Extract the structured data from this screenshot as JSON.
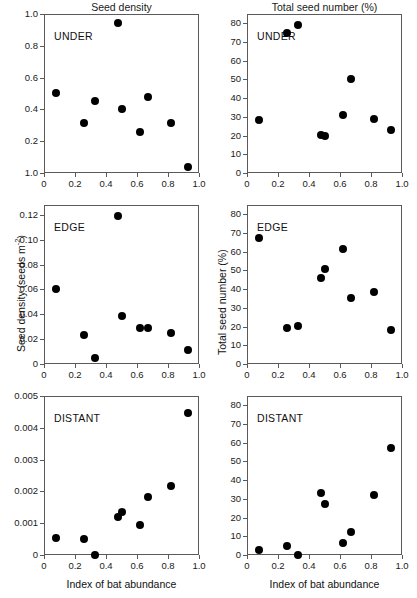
{
  "figure": {
    "column_titles": [
      "Seed density",
      "Total seed number (%)"
    ],
    "x_axis_label": "Index of bat abundance",
    "x_ticks": [
      "0",
      "0.2",
      "0.4",
      "0.6",
      "0.8",
      "1.0"
    ],
    "x_range": [
      0,
      1
    ],
    "marker_color": "#000000",
    "axis_color": "#5a5a5a"
  },
  "chart_data": [
    {
      "type": "scatter",
      "panel": "top-left",
      "title": "Seed density",
      "annotation": "UNDER",
      "xlabel": "",
      "ylabel": "",
      "xlim": [
        0,
        1
      ],
      "ylim": [
        0,
        1
      ],
      "xticks": [
        "0",
        "0.2",
        "0.4",
        "0.6",
        "0.8",
        "1.0"
      ],
      "yticks": [
        "1.0",
        "0.8",
        "0.6",
        "0.4",
        "0.2",
        "1.0"
      ],
      "ytick_values": [
        1.0,
        0.8,
        0.6,
        0.4,
        0.2,
        0.0
      ],
      "grid": false,
      "legend": "none",
      "x": [
        0.08,
        0.26,
        0.33,
        0.48,
        0.5,
        0.62,
        0.67,
        0.82,
        0.93
      ],
      "y": [
        0.505,
        0.315,
        0.455,
        0.945,
        0.405,
        0.255,
        0.475,
        0.315,
        0.035
      ]
    },
    {
      "type": "scatter",
      "panel": "top-right",
      "title": "Total seed number (%)",
      "annotation": "UNDER",
      "xlabel": "",
      "ylabel": "",
      "xlim": [
        0,
        1
      ],
      "ylim": [
        0,
        85
      ],
      "xticks": [
        "0",
        "0.2",
        "0.4",
        "0.6",
        "0.8",
        "1.0"
      ],
      "yticks": [
        "80",
        "70",
        "60",
        "50",
        "40",
        "30",
        "20",
        "10",
        "0"
      ],
      "ytick_values": [
        80,
        70,
        60,
        50,
        40,
        30,
        20,
        10,
        0
      ],
      "grid": false,
      "legend": "none",
      "x": [
        0.08,
        0.26,
        0.33,
        0.48,
        0.5,
        0.62,
        0.67,
        0.82,
        0.93
      ],
      "y": [
        28.5,
        75.0,
        79.0,
        20.5,
        20.0,
        31.0,
        50.5,
        29.0,
        23.0
      ]
    },
    {
      "type": "scatter",
      "panel": "middle-left",
      "title": "",
      "annotation": "EDGE",
      "xlabel": "",
      "ylabel": "Seed density (seeds m-2)",
      "xlim": [
        0,
        1
      ],
      "ylim": [
        0,
        0.128
      ],
      "xticks": [
        "0",
        "0.2",
        "0.4",
        "0.6",
        "0.8",
        "1.0"
      ],
      "yticks": [
        "0.12",
        "0.10",
        "0.08",
        "0.06",
        "0.04",
        "0.02",
        "0"
      ],
      "ytick_values": [
        0.12,
        0.1,
        0.08,
        0.06,
        0.04,
        0.02,
        0
      ],
      "grid": false,
      "legend": "none",
      "x": [
        0.08,
        0.26,
        0.33,
        0.48,
        0.5,
        0.62,
        0.67,
        0.82,
        0.93
      ],
      "y": [
        0.06,
        0.023,
        0.005,
        0.119,
        0.039,
        0.029,
        0.029,
        0.025,
        0.011
      ]
    },
    {
      "type": "scatter",
      "panel": "middle-right",
      "title": "",
      "annotation": "EDGE",
      "xlabel": "",
      "ylabel": "Total seed number (%)",
      "xlim": [
        0,
        1
      ],
      "ylim": [
        0,
        85
      ],
      "xticks": [
        "0",
        "0.2",
        "0.4",
        "0.6",
        "0.8",
        "1.0"
      ],
      "yticks": [
        "80",
        "70",
        "60",
        "50",
        "40",
        "30",
        "20",
        "10",
        "0"
      ],
      "ytick_values": [
        80,
        70,
        60,
        50,
        40,
        30,
        20,
        10,
        0
      ],
      "grid": false,
      "legend": "none",
      "x": [
        0.08,
        0.26,
        0.33,
        0.48,
        0.5,
        0.62,
        0.67,
        0.82,
        0.93
      ],
      "y": [
        67.5,
        19.0,
        20.5,
        46.0,
        51.0,
        61.5,
        35.5,
        38.5,
        18.0
      ]
    },
    {
      "type": "scatter",
      "panel": "bottom-left",
      "title": "",
      "annotation": "DISTANT",
      "xlabel": "Index of bat abundance",
      "ylabel": "",
      "xlim": [
        0,
        1
      ],
      "ylim": [
        0,
        0.005
      ],
      "xticks": [
        "0",
        "0.2",
        "0.4",
        "0.6",
        "0.8",
        "1.0"
      ],
      "yticks": [
        "0.005",
        "0.004",
        "0.003",
        "0.002",
        "0.001",
        "0"
      ],
      "ytick_values": [
        0.005,
        0.004,
        0.003,
        0.002,
        0.001,
        0
      ],
      "grid": false,
      "legend": "none",
      "x": [
        0.08,
        0.26,
        0.33,
        0.48,
        0.5,
        0.62,
        0.67,
        0.82,
        0.93
      ],
      "y": [
        0.00055,
        0.0005,
        0.0,
        0.0012,
        0.00135,
        0.00095,
        0.00182,
        0.00217,
        0.00445
      ]
    },
    {
      "type": "scatter",
      "panel": "bottom-right",
      "title": "",
      "annotation": "DISTANT",
      "xlabel": "Index of bat abundance",
      "ylabel": "",
      "xlim": [
        0,
        1
      ],
      "ylim": [
        0,
        85
      ],
      "xticks": [
        "0",
        "0.2",
        "0.4",
        "0.6",
        "0.8",
        "1.0"
      ],
      "yticks": [
        "80",
        "70",
        "60",
        "50",
        "40",
        "30",
        "20",
        "10",
        "0"
      ],
      "ytick_values": [
        80,
        70,
        60,
        50,
        40,
        30,
        20,
        10,
        0
      ],
      "grid": false,
      "legend": "none",
      "x": [
        0.08,
        0.26,
        0.33,
        0.48,
        0.5,
        0.62,
        0.67,
        0.82,
        0.93
      ],
      "y": [
        2.5,
        5.0,
        0.0,
        33.0,
        27.5,
        6.5,
        12.5,
        32.0,
        57.0
      ]
    }
  ],
  "axis_titles": {
    "middle_left_y": "Seed density (seeds m",
    "middle_left_y_sup": "-2",
    "middle_left_y_tail": ")",
    "middle_right_y": "Total seed number (%)"
  }
}
